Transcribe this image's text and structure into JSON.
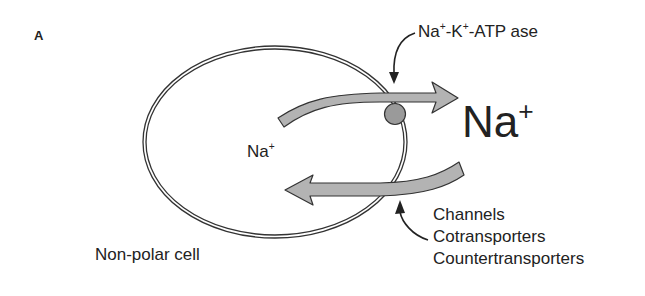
{
  "figure": {
    "panel_label": "A",
    "cell_label": "Non-polar cell",
    "intracellular_ion": {
      "symbol": "Na",
      "charge": "+"
    },
    "extracellular_ion": {
      "symbol": "Na",
      "charge": "+"
    },
    "pump_label": {
      "parts": [
        "Na",
        "+",
        "-K",
        "+",
        "-ATP ase"
      ]
    },
    "influx_pathways": [
      "Channels",
      "Cotransporters",
      "Countertransporters"
    ],
    "colors": {
      "arrow_fill": "#b3b3b3",
      "arrow_stroke": "#333333",
      "pump_fill": "#9a9a9a",
      "membrane": "#333333",
      "text": "#222222"
    }
  }
}
